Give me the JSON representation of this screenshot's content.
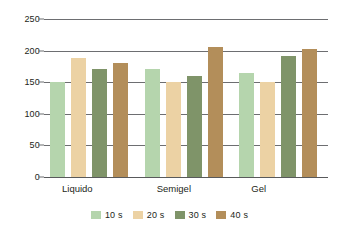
{
  "chart_data": {
    "type": "bar",
    "title": "",
    "subtitle": "",
    "xlabel": "",
    "ylabel": "",
    "categories": [
      "Liquido",
      "Semigel",
      "Gel"
    ],
    "series": [
      {
        "name": "10 s",
        "color": "#b5d5ad",
        "values": [
          150,
          171,
          164
        ]
      },
      {
        "name": "20 s",
        "color": "#ecd2a4",
        "values": [
          189,
          151,
          151
        ]
      },
      {
        "name": "30 s",
        "color": "#7f9469",
        "values": [
          171,
          160,
          191
        ]
      },
      {
        "name": "40 s",
        "color": "#b38e5a",
        "values": [
          181,
          205,
          202
        ]
      }
    ],
    "ylim": [
      0,
      250
    ],
    "yticks": [
      0,
      50,
      100,
      150,
      200,
      250
    ],
    "ytick_labels": [
      "0",
      "50",
      "100",
      "150",
      "200",
      "250"
    ],
    "grid": true,
    "grid_color": "#6d6e71",
    "legend_position": "bottom",
    "background": "#ffffff",
    "text_color": "#231f20"
  },
  "legend": {
    "items": [
      {
        "label": "10 s"
      },
      {
        "label": "20 s"
      },
      {
        "label": "30 s"
      },
      {
        "label": "40 s"
      }
    ]
  }
}
